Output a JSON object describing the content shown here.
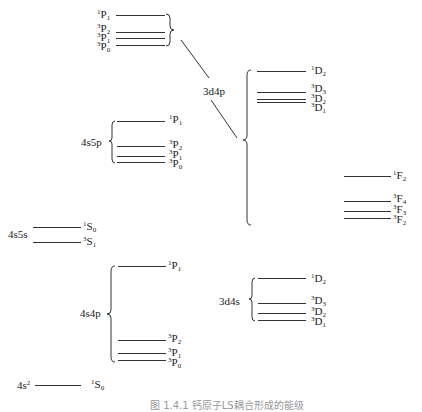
{
  "diagram": {
    "configurations": [
      {
        "id": "4s2",
        "label": "4s",
        "sup": "2"
      },
      {
        "id": "4s4p",
        "label": "4s4p"
      },
      {
        "id": "4s5s",
        "label": "4s5s"
      },
      {
        "id": "4s5p",
        "label": "4s5p"
      },
      {
        "id": "3d4s",
        "label": "3d4s"
      },
      {
        "id": "3d4p",
        "label": "3d4p"
      }
    ],
    "levels": {
      "g_4s2": [
        {
          "mult": "1",
          "L": "S",
          "J": "0"
        }
      ],
      "g_4s4p": [
        {
          "mult": "1",
          "L": "P",
          "J": "1"
        },
        {
          "mult": "3",
          "L": "P",
          "J": "2"
        },
        {
          "mult": "3",
          "L": "P",
          "J": "1"
        },
        {
          "mult": "3",
          "L": "P",
          "J": "0"
        }
      ],
      "g_4s5s": [
        {
          "mult": "1",
          "L": "S",
          "J": "0"
        },
        {
          "mult": "3",
          "L": "S",
          "J": "1"
        }
      ],
      "g_4s5p": [
        {
          "mult": "1",
          "L": "P",
          "J": "1"
        },
        {
          "mult": "3",
          "L": "P",
          "J": "2"
        },
        {
          "mult": "3",
          "L": "P",
          "J": "1"
        },
        {
          "mult": "3",
          "L": "P",
          "J": "0"
        }
      ],
      "g_3d4s": [
        {
          "mult": "1",
          "L": "D",
          "J": "2"
        },
        {
          "mult": "3",
          "L": "D",
          "J": "3"
        },
        {
          "mult": "3",
          "L": "D",
          "J": "2"
        },
        {
          "mult": "3",
          "L": "D",
          "J": "1"
        }
      ],
      "g_3d4p_P": [
        {
          "mult": "1",
          "L": "P",
          "J": "1"
        },
        {
          "mult": "3",
          "L": "P",
          "J": "2"
        },
        {
          "mult": "3",
          "L": "P",
          "J": "1"
        },
        {
          "mult": "3",
          "L": "P",
          "J": "0"
        }
      ],
      "g_3d4p_D": [
        {
          "mult": "1",
          "L": "D",
          "J": "2"
        },
        {
          "mult": "3",
          "L": "D",
          "J": "3"
        },
        {
          "mult": "3",
          "L": "D",
          "J": "2"
        },
        {
          "mult": "3",
          "L": "D",
          "J": "1"
        }
      ],
      "g_3d4p_F": [
        {
          "mult": "1",
          "L": "F",
          "J": "2"
        },
        {
          "mult": "3",
          "L": "F",
          "J": "4"
        },
        {
          "mult": "3",
          "L": "F",
          "J": "3"
        },
        {
          "mult": "3",
          "L": "F",
          "J": "2"
        }
      ]
    },
    "caption": "图 1.4.1 钙原子LS耦合形成的能级"
  }
}
